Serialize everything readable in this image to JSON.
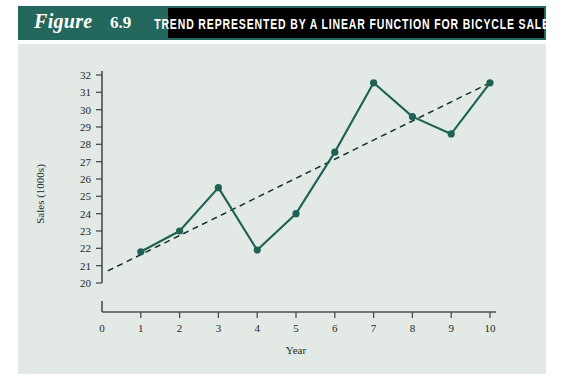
{
  "figure": {
    "word": "Figure",
    "number": "6.9",
    "title": "TREND REPRESENTED BY A LINEAR FUNCTION FOR BICYCLE SALES",
    "banner_color": "#24675c",
    "title_bar_color": "#000000",
    "plot_background": "#e3eae6"
  },
  "chart_data": {
    "type": "line",
    "title": "TREND REPRESENTED BY A LINEAR FUNCTION FOR BICYCLE SALES",
    "xlabel": "Year",
    "ylabel": "Sales (1000s)",
    "x": [
      1,
      2,
      3,
      4,
      5,
      6,
      7,
      8,
      9,
      10
    ],
    "xlim": [
      0,
      10
    ],
    "ylim": [
      20,
      32
    ],
    "y_axis_break": true,
    "y_origin_label": "0",
    "grid": false,
    "legend": "none",
    "xticks": [
      "0",
      "1",
      "2",
      "3",
      "4",
      "5",
      "6",
      "7",
      "8",
      "9",
      "10"
    ],
    "yticks": [
      "20",
      "21",
      "22",
      "23",
      "24",
      "25",
      "26",
      "27",
      "28",
      "29",
      "30",
      "31",
      "32"
    ],
    "series": [
      {
        "name": "Bicycle sales",
        "style": "solid-with-markers",
        "color": "#1f6154",
        "values": [
          21.8,
          23.0,
          25.5,
          21.9,
          24.0,
          27.55,
          31.55,
          29.6,
          28.6,
          31.55
        ]
      },
      {
        "name": "Linear trend",
        "style": "dashed",
        "color": "#14302c",
        "endpoints_x": [
          0.15,
          10.0
        ],
        "endpoints_y": [
          20.7,
          31.55
        ]
      }
    ]
  }
}
